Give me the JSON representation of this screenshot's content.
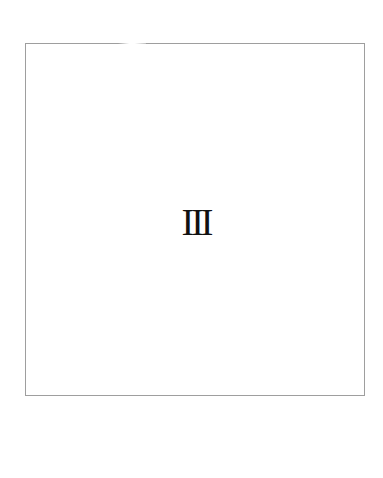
{
  "page": {
    "numeral": "III",
    "frame_border_color": "#9e9e9e",
    "text_color": "#111111",
    "background_color": "#ffffff"
  }
}
